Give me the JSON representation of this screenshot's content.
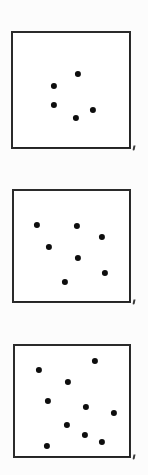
{
  "figure": {
    "width": 148,
    "height": 475,
    "background_color": "#fcfcfc",
    "panel_border_color": "#2b2b2b",
    "dot_color": "#0d0d0d",
    "panel_fill_color": "#ffffff"
  },
  "chart_data": {
    "type": "scatter",
    "subtitle": "",
    "xlabel": "",
    "ylabel": "",
    "grid": false,
    "legend": "none",
    "axis_ticks": false,
    "xlim": [
      0,
      100
    ],
    "ylim": [
      0,
      100
    ],
    "panel_count": 3,
    "panels": [
      {
        "name": "panel-1",
        "label": "",
        "dot_count": 5,
        "frame_px": {
          "x": 11,
          "y": 31,
          "width": 120,
          "height": 118
        },
        "dot_radius_px": 3.1,
        "points": [
          {
            "x": 54.2,
            "y": 64.6
          },
          {
            "x": 33.9,
            "y": 55.1
          },
          {
            "x": 34.4,
            "y": 39.3
          },
          {
            "x": 66.4,
            "y": 35.1
          },
          {
            "x": 52.8,
            "y": 28.4
          }
        ],
        "points_px": [
          {
            "x": 76,
            "y": 72
          },
          {
            "x": 52,
            "y": 84
          },
          {
            "x": 52,
            "y": 103
          },
          {
            "x": 91,
            "y": 108
          },
          {
            "x": 74,
            "y": 116
          }
        ]
      },
      {
        "name": "panel-2",
        "label": "",
        "dot_count": 7,
        "frame_px": {
          "x": 12,
          "y": 189,
          "width": 119,
          "height": 114
        },
        "dot_radius_px": 3.1,
        "points": [
          {
            "x": 19.3,
            "y": 69.3
          },
          {
            "x": 52.9,
            "y": 68.4
          },
          {
            "x": 73.9,
            "y": 59.6
          },
          {
            "x": 29.4,
            "y": 49.1
          },
          {
            "x": 53.8,
            "y": 39.5
          },
          {
            "x": 76.5,
            "y": 26.3
          },
          {
            "x": 42.9,
            "y": 18.4
          }
        ],
        "points_px": [
          {
            "x": 35,
            "y": 223
          },
          {
            "x": 75,
            "y": 224
          },
          {
            "x": 100,
            "y": 235
          },
          {
            "x": 47,
            "y": 245
          },
          {
            "x": 76,
            "y": 256
          },
          {
            "x": 103,
            "y": 271
          },
          {
            "x": 63,
            "y": 280
          }
        ]
      },
      {
        "name": "panel-3",
        "label": "",
        "dot_count": 10,
        "frame_px": {
          "x": 13,
          "y": 344,
          "width": 118,
          "height": 114
        },
        "dot_radius_px": 3.1,
        "points": [
          {
            "x": 67.4,
            "y": 86.8
          },
          {
            "x": 20.1,
            "y": 78.9
          },
          {
            "x": 44.9,
            "y": 68.4
          },
          {
            "x": 27.6,
            "y": 51.8
          },
          {
            "x": 60.1,
            "y": 46.5
          },
          {
            "x": 84.0,
            "y": 41.6
          },
          {
            "x": 44.0,
            "y": 31.1
          },
          {
            "x": 59.1,
            "y": 21.9
          },
          {
            "x": 73.7,
            "y": 15.8
          },
          {
            "x": 27.3,
            "y": 14.0
          }
        ],
        "points_px": [
          {
            "x": 93,
            "y": 359
          },
          {
            "x": 37,
            "y": 368
          },
          {
            "x": 66,
            "y": 380
          },
          {
            "x": 46,
            "y": 399
          },
          {
            "x": 84,
            "y": 405
          },
          {
            "x": 112,
            "y": 411
          },
          {
            "x": 65,
            "y": 423
          },
          {
            "x": 83,
            "y": 433
          },
          {
            "x": 100,
            "y": 440
          },
          {
            "x": 45,
            "y": 444
          }
        ]
      }
    ],
    "corner_marks": [
      {
        "panel": "panel-1",
        "x": 134,
        "y": 148
      },
      {
        "panel": "panel-2",
        "x": 134,
        "y": 302
      },
      {
        "panel": "panel-3",
        "x": 134,
        "y": 457
      }
    ]
  }
}
